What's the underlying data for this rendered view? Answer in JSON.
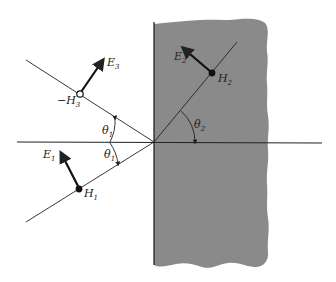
{
  "diagram": {
    "colors": {
      "background": "#ffffff",
      "medium2_fill": "#8a8a8a",
      "line": "#222222"
    },
    "labels": {
      "E1": {
        "main": "E",
        "sub": "1"
      },
      "H1": {
        "main": "H",
        "sub": "1"
      },
      "E2": {
        "main": "E",
        "sub": "2"
      },
      "H2": {
        "main": "H",
        "sub": "2"
      },
      "E3": {
        "main": "E",
        "sub": "3"
      },
      "H3": {
        "main": "−H",
        "sub": "3"
      },
      "theta1_upper": {
        "main": "θ",
        "sub": "1"
      },
      "theta1_lower": {
        "main": "θ",
        "sub": "1"
      },
      "theta2": {
        "main": "θ",
        "sub": "2"
      }
    },
    "elements": {
      "incident_ray": "incident wave direction (lower-left to origin)",
      "reflected_ray": "reflected wave direction (origin to upper-left)",
      "transmitted_ray": "transmitted wave direction (origin to upper-right)",
      "interface": "vertical boundary between media",
      "normal": "horizontal normal line",
      "medium2": "shaded second medium"
    }
  }
}
